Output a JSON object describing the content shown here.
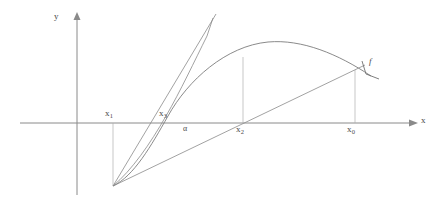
{
  "figure": {
    "kind": "math-diagram",
    "background_color": "#ffffff",
    "line_color": "#8a8a8a",
    "curve_color": "#7d7d7d",
    "label_color": "#4a4a4a",
    "axes": {
      "y_label": "y",
      "x_label": "x",
      "origin_px": {
        "x": 77,
        "y": 123
      },
      "x_axis_from_px": 20,
      "x_axis_to_px": 415,
      "y_axis_from_px": 195,
      "y_axis_to_px": 14
    },
    "labels": [
      {
        "name": "y-axis-label",
        "text": "y",
        "sub": "",
        "x": 56,
        "y": 16,
        "style": "axis"
      },
      {
        "name": "x-axis-label",
        "text": "x",
        "sub": "",
        "x": 421,
        "y": 118,
        "style": "axis"
      },
      {
        "name": "x1-label",
        "text": "x",
        "sub": "1",
        "x": 106,
        "y": 110,
        "style": "var"
      },
      {
        "name": "x3-label",
        "text": "x",
        "sub": "3",
        "x": 160,
        "y": 110,
        "style": "var"
      },
      {
        "name": "alpha-label",
        "text": "α",
        "sub": "",
        "x": 183,
        "y": 126,
        "style": "alpha"
      },
      {
        "name": "x2-label",
        "text": "x",
        "sub": "2",
        "x": 237,
        "y": 126,
        "style": "var"
      },
      {
        "name": "x0-label",
        "text": "x",
        "sub": "0",
        "x": 348,
        "y": 126,
        "style": "var"
      },
      {
        "name": "f-label",
        "text": "f",
        "sub": "",
        "x": 369,
        "y": 59,
        "style": "fn"
      }
    ],
    "points": {
      "start_point_px": {
        "x": 113,
        "y": 186
      },
      "x1_px": 113,
      "x3_px": 172,
      "alpha_px": 186,
      "x2_px": 243,
      "x0_px": 355,
      "curve_peak_px": {
        "x": 282,
        "y": 44
      },
      "f_at_x0_px": {
        "x": 355,
        "y": 70
      },
      "f_at_x2_px": {
        "x": 243,
        "y": 57
      }
    },
    "geometry": {
      "curve_path": "M 113 186 C 135 175 152 140 172 108 C 200 64 240 40 282 44 C 320 48 345 60 371 76",
      "chord_path": "M 113 186 L 355 70",
      "tangent_path": "M 113 186 L 213 14",
      "secant2_path": "M 113 186 C 133 166 152 135 170 106 C 183 84 196 59 207 36 L 213 14",
      "drop_x1": "M 113 123 L 113 186",
      "drop_x2": "M 243 57 L 243 123",
      "drop_x0": "M 355 70 L 355 123",
      "f_tick_path": "M 363 62 L 366 75 L 378 79"
    }
  }
}
